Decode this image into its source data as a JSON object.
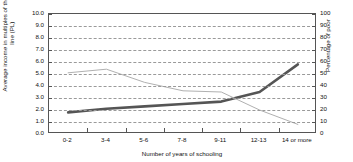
{
  "chart_data": {
    "type": "line",
    "title": "",
    "clipped_title_fragment": "",
    "categories": [
      "0-2",
      "3-4",
      "5-6",
      "7-8",
      "9-11",
      "12-13",
      "14 or more"
    ],
    "xlabel": "Number of years of schooling",
    "grid": true,
    "legend": "none",
    "axes": {
      "left": {
        "label": "Average income in multiples of the poverty line (PL)",
        "ylim": [
          0.0,
          10.0
        ],
        "tick_step": 1.0,
        "ticks": [
          "10.0",
          "9.0",
          "8.0",
          "7.0",
          "6.0",
          "5.0",
          "4.0",
          "3.0",
          "2.0",
          "1.0",
          "0.0"
        ]
      },
      "right": {
        "label": "Percentage of poor",
        "ylim": [
          0,
          100
        ],
        "tick_step": 10,
        "ticks": [
          "100",
          "90",
          "80",
          "70",
          "60",
          "50",
          "40",
          "30",
          "20",
          "10",
          "0"
        ]
      }
    },
    "series": [
      {
        "name": "Average income in multiples of the poverty line (PL)",
        "axis": "left",
        "color": "#555555",
        "width": 2.6,
        "values": [
          1.8,
          2.1,
          2.3,
          2.5,
          2.7,
          3.5,
          5.8
        ]
      },
      {
        "name": "Percentage of poor",
        "axis": "right",
        "color": "#b0b0b0",
        "width": 1.0,
        "values": [
          51,
          54,
          43,
          36,
          35,
          20,
          8
        ]
      }
    ]
  }
}
